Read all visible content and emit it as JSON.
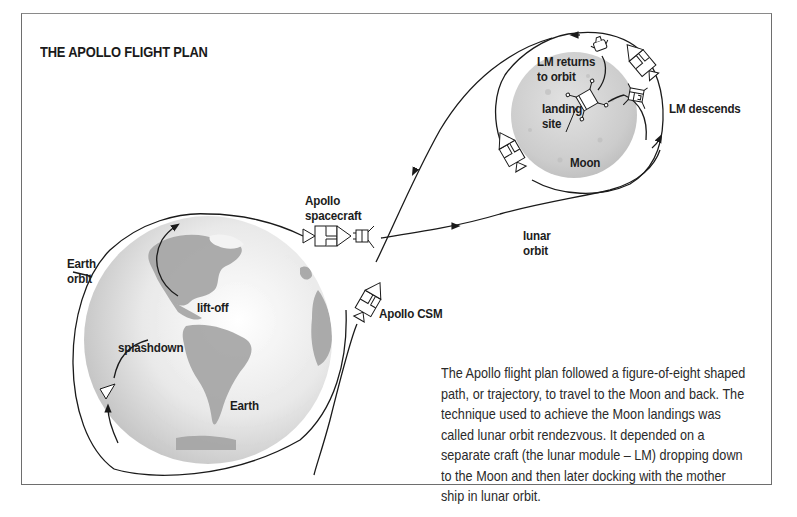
{
  "title": "THE APOLLO FLIGHT PLAN",
  "labels": {
    "lm_returns": [
      "LM returns",
      "to orbit"
    ],
    "landing_site": [
      "landing",
      "site"
    ],
    "moon": "Moon",
    "lm_descends": "LM descends",
    "apollo_spacecraft": [
      "Apollo",
      "spacecraft"
    ],
    "lunar_orbit": [
      "lunar",
      "orbit"
    ],
    "earth_orbit": [
      "Earth",
      "orbit"
    ],
    "lift_off": "lift-off",
    "apollo_csm": "Apollo CSM",
    "splashdown": "splashdown",
    "earth": "Earth"
  },
  "caption": {
    "lines": [
      "The Apollo flight plan followed a figure-of-eight shaped",
      "path, or trajectory, to travel to the Moon and back. The",
      "technique used to achieve the Moon landings was",
      "called lunar orbit rendezvous. It depended on a",
      "separate craft (the lunar module – LM) dropping down",
      "to the Moon and then later docking with the mother",
      "ship in lunar orbit."
    ]
  },
  "colors": {
    "frame": "#6e6e6e",
    "earth_ocean": "#e6e6e6",
    "earth_land": "#9c9c9c",
    "moon": "#cfcfcf",
    "line": "#1a1a1a"
  }
}
